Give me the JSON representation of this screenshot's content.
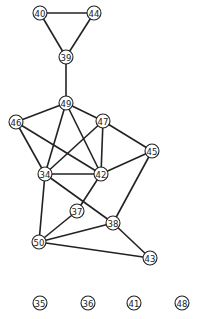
{
  "diagram": {
    "type": "undirected-graph",
    "style": {
      "edge_color": "#222222",
      "node_fill": "#ffffff",
      "node_stroke": "#222222",
      "background": "#ffffff"
    },
    "nodes": [
      {
        "id": "40",
        "label": "40",
        "x": 40,
        "y": 13
      },
      {
        "id": "44",
        "label": "44",
        "x": 94,
        "y": 13
      },
      {
        "id": "39",
        "label": "39",
        "x": 66,
        "y": 57
      },
      {
        "id": "49",
        "label": "49",
        "x": 66,
        "y": 103
      },
      {
        "id": "46",
        "label": "46",
        "x": 16,
        "y": 122
      },
      {
        "id": "47",
        "label": "47",
        "x": 103,
        "y": 121
      },
      {
        "id": "45",
        "label": "45",
        "x": 152,
        "y": 151
      },
      {
        "id": "34",
        "label": "34",
        "x": 45,
        "y": 174
      },
      {
        "id": "42",
        "label": "42",
        "x": 101,
        "y": 174
      },
      {
        "id": "37",
        "label": "37",
        "x": 77,
        "y": 211
      },
      {
        "id": "38",
        "label": "38",
        "x": 113,
        "y": 223
      },
      {
        "id": "50",
        "label": "50",
        "x": 39,
        "y": 242
      },
      {
        "id": "43",
        "label": "43",
        "x": 150,
        "y": 258
      },
      {
        "id": "35",
        "label": "35",
        "x": 40,
        "y": 303
      },
      {
        "id": "36",
        "label": "36",
        "x": 88,
        "y": 303
      },
      {
        "id": "41",
        "label": "41",
        "x": 134,
        "y": 303
      },
      {
        "id": "48",
        "label": "48",
        "x": 182,
        "y": 303
      }
    ],
    "edges": [
      [
        "40",
        "44"
      ],
      [
        "40",
        "39"
      ],
      [
        "44",
        "39"
      ],
      [
        "39",
        "49"
      ],
      [
        "49",
        "46"
      ],
      [
        "49",
        "47"
      ],
      [
        "49",
        "34"
      ],
      [
        "49",
        "42"
      ],
      [
        "46",
        "34"
      ],
      [
        "46",
        "42"
      ],
      [
        "47",
        "34"
      ],
      [
        "47",
        "42"
      ],
      [
        "47",
        "45"
      ],
      [
        "45",
        "42"
      ],
      [
        "45",
        "38"
      ],
      [
        "34",
        "42"
      ],
      [
        "34",
        "50"
      ],
      [
        "34",
        "38"
      ],
      [
        "42",
        "37"
      ],
      [
        "37",
        "50"
      ],
      [
        "38",
        "50"
      ],
      [
        "38",
        "43"
      ],
      [
        "50",
        "43"
      ]
    ],
    "isolated_nodes": [
      "35",
      "36",
      "41",
      "48"
    ]
  }
}
